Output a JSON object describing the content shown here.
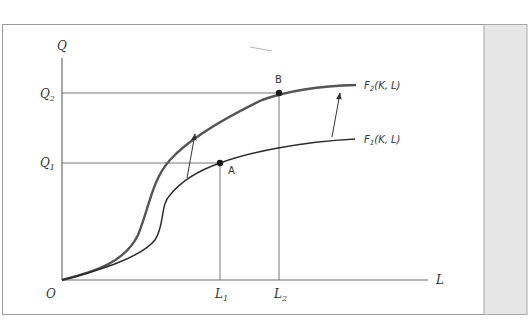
{
  "diagram": {
    "title": "",
    "axes": {
      "y_label": "Q",
      "x_label": "L",
      "origin_label": "O"
    },
    "y_ticks": [
      {
        "main": "Q",
        "sub": "2"
      },
      {
        "main": "Q",
        "sub": "1"
      }
    ],
    "x_ticks": [
      {
        "main": "L",
        "sub": "1"
      },
      {
        "main": "L",
        "sub": "2"
      }
    ],
    "points": [
      {
        "label": "A"
      },
      {
        "label": "B"
      }
    ],
    "curves": [
      {
        "name": "F",
        "sub": "1",
        "args": "(K, L)",
        "color": "#2b2b2b"
      },
      {
        "name": "F",
        "sub": "2",
        "args": "(K, L)",
        "color": "#555555"
      }
    ],
    "colors": {
      "frame": "#9a9a9a",
      "axis": "#6e6e6e",
      "sidebar": "#e6e6e6",
      "guide": "#777777"
    }
  }
}
